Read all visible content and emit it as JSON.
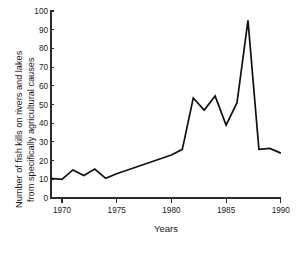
{
  "chart_data": {
    "type": "line",
    "title": "",
    "xlabel": "Years",
    "ylabel": "Number of fish kills on rivers and lakes from specifically agricultural causes",
    "ylabel_lines": [
      "Number of fish kills on rivers and lakes",
      "from specifically agricultural causes"
    ],
    "xlim": [
      1969,
      1990
    ],
    "ylim": [
      0,
      100
    ],
    "grid": false,
    "legend": "none",
    "x_ticks": [
      1970,
      1975,
      1980,
      1985,
      1990
    ],
    "x_tick_labels": [
      "1970",
      "1975",
      "1980",
      "1985",
      "1990"
    ],
    "y_ticks": [
      0,
      10,
      20,
      30,
      40,
      50,
      60,
      70,
      80,
      90,
      100
    ],
    "y_tick_labels": [
      "0",
      "10",
      "20",
      "30",
      "40",
      "50",
      "60",
      "70",
      "80",
      "90",
      "100"
    ],
    "x": [
      1969,
      1970,
      1971,
      1972,
      1973,
      1974,
      1975,
      1976,
      1977,
      1978,
      1979,
      1980,
      1981,
      1982,
      1983,
      1984,
      1985,
      1986,
      1987,
      1988,
      1989,
      1990
    ],
    "values": [
      10.5,
      10,
      15,
      12,
      15.5,
      10.5,
      13,
      15,
      17,
      19,
      21,
      23,
      26,
      53.5,
      47,
      54.5,
      39,
      51,
      95,
      26,
      26.5,
      24
    ],
    "series": [
      {
        "name": "Fish kills from agricultural causes",
        "color": "#111111",
        "values": [
          10.5,
          10,
          15,
          12,
          15.5,
          10.5,
          13,
          15,
          17,
          19,
          21,
          23,
          26,
          53.5,
          47,
          54.5,
          39,
          51,
          95,
          26,
          26.5,
          24
        ]
      }
    ]
  }
}
